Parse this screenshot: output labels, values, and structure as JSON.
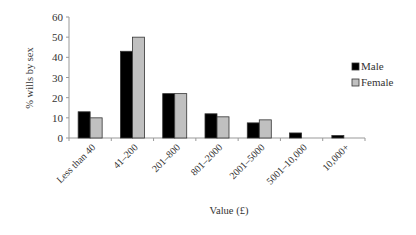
{
  "chart_data": {
    "type": "bar",
    "title": "",
    "xlabel": "Value (£)",
    "ylabel": "% wills by sex",
    "ylim": [
      0,
      60
    ],
    "yticks": [
      0,
      10,
      20,
      30,
      40,
      50,
      60
    ],
    "grid": false,
    "legend_position": "right",
    "categories": [
      "Less than 40",
      "41–200",
      "201–800",
      "801–2000",
      "2001–5000",
      "5001–10,000",
      "10,000+"
    ],
    "series": [
      {
        "name": "Male",
        "color": "#000000",
        "values": [
          13,
          43,
          22,
          12,
          7.5,
          2.5,
          1.2
        ]
      },
      {
        "name": "Female",
        "color": "#c0c0c0",
        "values": [
          10,
          50,
          22,
          10.5,
          9,
          0,
          0
        ]
      }
    ]
  }
}
